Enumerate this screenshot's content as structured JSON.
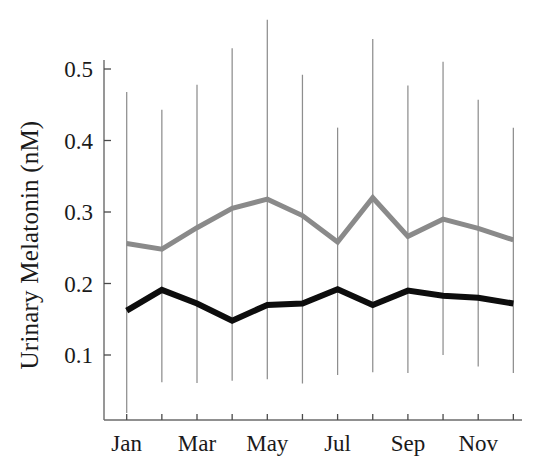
{
  "figure": {
    "background_color": "#ffffff",
    "y_axis_title": "Urinary  Melatonin  (nM)"
  },
  "axes": {
    "y_ticks": [
      "0.5",
      "0.4",
      "0.3",
      "0.2",
      "0.1"
    ],
    "x_tick_labels": [
      "Jan",
      "",
      "Mar",
      "",
      "May",
      "",
      "Jul",
      "",
      "Sep",
      "",
      "Nov",
      ""
    ]
  },
  "colors": {
    "series_upper": "#8a8a8a",
    "series_lower": "#0d0d0d",
    "error_bars": "#8e8e8e",
    "axis": "#6b6b6b",
    "text": "#1a1a1a"
  },
  "chart_data": {
    "type": "line",
    "title": "",
    "xlabel": "",
    "ylabel": "Urinary  Melatonin  (nM)",
    "ylim": [
      0.0,
      0.58
    ],
    "y_ticks": [
      0.1,
      0.2,
      0.3,
      0.4,
      0.5
    ],
    "grid": false,
    "legend": "none",
    "categories": [
      "Jan",
      "Feb",
      "Mar",
      "Apr",
      "May",
      "Jun",
      "Jul",
      "Aug",
      "Sep",
      "Oct",
      "Nov",
      "Dec"
    ],
    "x": [
      1,
      2,
      3,
      4,
      5,
      6,
      7,
      8,
      9,
      10,
      11,
      12
    ],
    "series": [
      {
        "name": "upper-series",
        "color": "#8a8a8a",
        "linewidth": 5,
        "values": [
          0.256,
          0.248,
          0.278,
          0.305,
          0.318,
          0.295,
          0.258,
          0.32,
          0.266,
          0.29,
          0.277,
          0.261
        ]
      },
      {
        "name": "lower-series",
        "color": "#0d0d0d",
        "linewidth": 6,
        "values": [
          0.162,
          0.191,
          0.172,
          0.148,
          0.17,
          0.172,
          0.192,
          0.17,
          0.19,
          0.183,
          0.18,
          0.172
        ]
      }
    ],
    "error_bars": {
      "note": "vertical range bars drawn at each month tick",
      "upper": [
        0.468,
        0.443,
        0.478,
        0.529,
        0.569,
        0.492,
        0.418,
        0.542,
        0.477,
        0.51,
        0.457,
        0.418
      ],
      "lower": [
        0.019,
        0.062,
        0.061,
        0.064,
        0.066,
        0.06,
        0.072,
        0.076,
        0.075,
        0.1,
        0.084,
        0.075
      ]
    }
  }
}
